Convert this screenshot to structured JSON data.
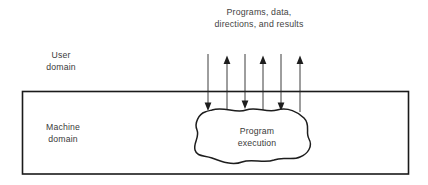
{
  "diagram": {
    "caption": {
      "line1": "Programs, data,",
      "line2": "directions, and results"
    },
    "user_domain_label": {
      "line1": "User",
      "line2": "domain"
    },
    "machine_domain_label": {
      "line1": "Machine",
      "line2": "domain"
    },
    "process_label": {
      "line1": "Program",
      "line2": "execution"
    },
    "colors": {
      "stroke": "#1a1a1a",
      "text": "#3a3a3a",
      "background": "#ffffff"
    },
    "arrows": [
      {
        "name": "arrow-down-1",
        "direction": "down",
        "x": 208
      },
      {
        "name": "arrow-up-1",
        "direction": "up",
        "x": 227
      },
      {
        "name": "arrow-down-2",
        "direction": "down",
        "x": 245
      },
      {
        "name": "arrow-up-2",
        "direction": "up",
        "x": 263
      },
      {
        "name": "arrow-down-3",
        "direction": "down",
        "x": 281
      },
      {
        "name": "arrow-up-3",
        "direction": "up",
        "x": 300
      }
    ]
  }
}
